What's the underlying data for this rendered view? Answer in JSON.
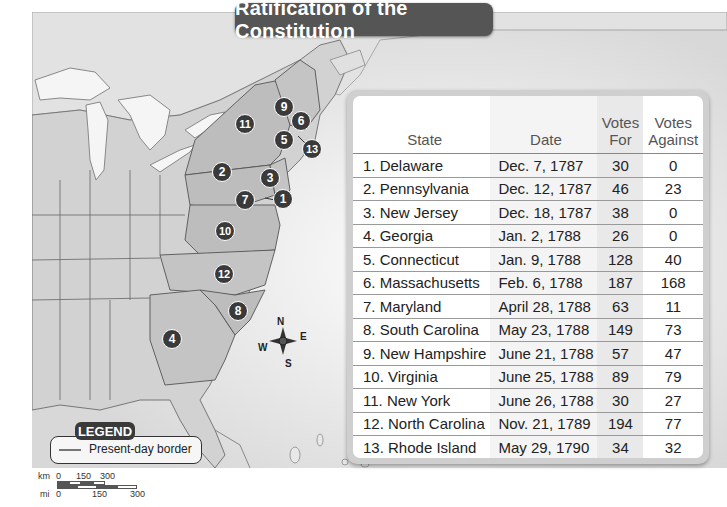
{
  "title": "Ratification of the Constitution",
  "table": {
    "headers": {
      "state": "State",
      "date": "Date",
      "votes_for": "Votes For",
      "votes_against": "Votes Against"
    },
    "rows": [
      {
        "state": "1. Delaware",
        "date": "Dec. 7, 1787",
        "for": "30",
        "against": "0"
      },
      {
        "state": "2. Pennsylvania",
        "date": "Dec. 12, 1787",
        "for": "46",
        "against": "23"
      },
      {
        "state": "3. New Jersey",
        "date": "Dec. 18, 1787",
        "for": "38",
        "against": "0"
      },
      {
        "state": "4. Georgia",
        "date": "Jan. 2, 1788",
        "for": "26",
        "against": "0"
      },
      {
        "state": "5. Connecticut",
        "date": "Jan. 9, 1788",
        "for": "128",
        "against": "40"
      },
      {
        "state": "6. Massachusetts",
        "date": "Feb. 6, 1788",
        "for": "187",
        "against": "168"
      },
      {
        "state": "7. Maryland",
        "date": "April 28, 1788",
        "for": "63",
        "against": "11"
      },
      {
        "state": "8. South Carolina",
        "date": "May 23, 1788",
        "for": "149",
        "against": "73"
      },
      {
        "state": "9. New Hampshire",
        "date": "June 21, 1788",
        "for": "57",
        "against": "47"
      },
      {
        "state": "10. Virginia",
        "date": "June 25, 1788",
        "for": "89",
        "against": "79"
      },
      {
        "state": "11. New York",
        "date": "June 26, 1788",
        "for": "30",
        "against": "27"
      },
      {
        "state": "12. North Carolina",
        "date": "Nov. 21, 1789",
        "for": "194",
        "against": "77"
      },
      {
        "state": "13. Rhode Island",
        "date": "May 29, 1790",
        "for": "34",
        "against": "32"
      }
    ]
  },
  "map": {
    "markers": [
      {
        "label": "1",
        "x": 283,
        "y": 199
      },
      {
        "label": "2",
        "x": 222,
        "y": 172
      },
      {
        "label": "3",
        "x": 270,
        "y": 178
      },
      {
        "label": "4",
        "x": 172,
        "y": 339
      },
      {
        "label": "5",
        "x": 284,
        "y": 140
      },
      {
        "label": "6",
        "x": 301,
        "y": 121
      },
      {
        "label": "7",
        "x": 245,
        "y": 200
      },
      {
        "label": "8",
        "x": 238,
        "y": 311
      },
      {
        "label": "9",
        "x": 284,
        "y": 107
      },
      {
        "label": "10",
        "x": 225,
        "y": 231
      },
      {
        "label": "11",
        "x": 245,
        "y": 124
      },
      {
        "label": "12",
        "x": 224,
        "y": 274
      },
      {
        "label": "13",
        "x": 312,
        "y": 149
      }
    ],
    "compass": {
      "n": "N",
      "e": "E",
      "s": "S",
      "w": "W"
    },
    "legend": {
      "title": "LEGEND",
      "items": [
        {
          "symbol": "line",
          "label": "Present-day border"
        }
      ]
    },
    "scale": {
      "km_label": "km",
      "km_ticks": [
        "0",
        "150",
        "300"
      ],
      "mi_label": "mi",
      "mi_ticks": [
        "0",
        "150",
        "300"
      ]
    }
  }
}
